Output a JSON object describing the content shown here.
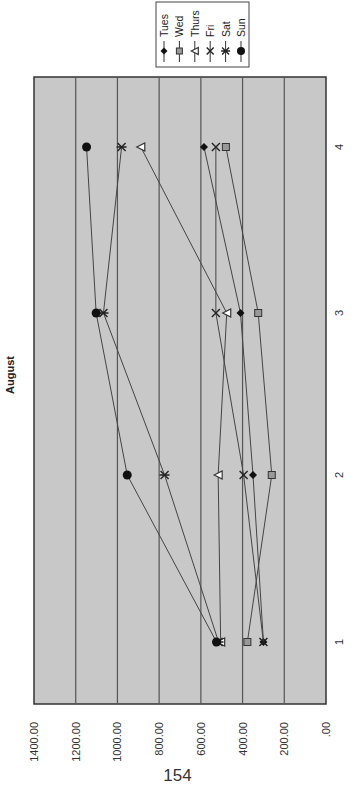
{
  "page": {
    "page_number": "154"
  },
  "chart_data": {
    "type": "line",
    "title": "August",
    "orientation": "rotated-90-ccw",
    "xlabel": "",
    "ylabel": "",
    "categories": [
      "1",
      "2",
      "3",
      "4"
    ],
    "ylim": [
      0,
      1400
    ],
    "yticks": [
      ".00",
      "200.00",
      "400.00",
      "600.00",
      "800.00",
      "1000.00",
      "1200.00",
      "1400.00"
    ],
    "grid": true,
    "legend_position": "top-right (rotated)",
    "plot_background": "#c8c8c8",
    "series": [
      {
        "name": "Tues",
        "marker": "diamond",
        "values": [
          300,
          350,
          410,
          585
        ]
      },
      {
        "name": "Wed",
        "marker": "square",
        "values": [
          377,
          260,
          325,
          480
        ]
      },
      {
        "name": "Thurs",
        "marker": "triangle",
        "values": [
          505,
          517,
          476,
          888
        ]
      },
      {
        "name": "Fri",
        "marker": "x",
        "values": [
          300,
          395,
          528,
          528
        ]
      },
      {
        "name": "Sat",
        "marker": "star",
        "values": [
          515,
          774,
          1067,
          980
        ]
      },
      {
        "name": "Sun",
        "marker": "circle",
        "values": [
          525,
          953,
          1102,
          1148
        ]
      }
    ]
  }
}
